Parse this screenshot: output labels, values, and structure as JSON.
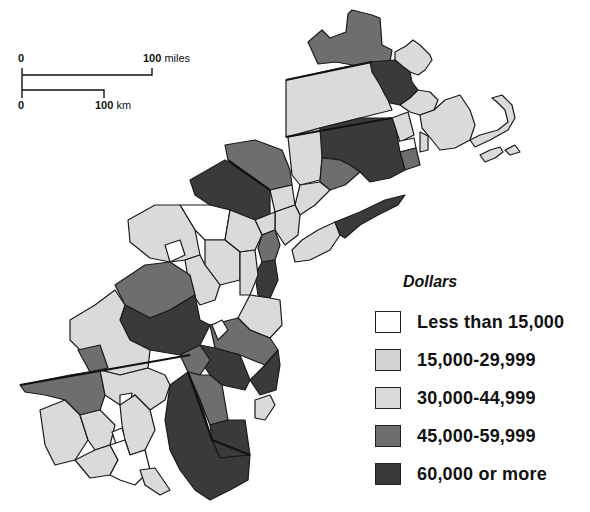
{
  "header": {
    "partial_title": "...ing..."
  },
  "scale_bar": {
    "miles": {
      "start": "0",
      "end": "100",
      "unit": "miles"
    },
    "km": {
      "start": "0",
      "end": "100",
      "unit": "km"
    }
  },
  "legend": {
    "title": "Dollars",
    "items": [
      {
        "label": "Less than 15,000",
        "color": "#ffffff"
      },
      {
        "label": "15,000-29,999",
        "color": "#d2d2d2"
      },
      {
        "label": "30,000-44,999",
        "color": "#dadada"
      },
      {
        "label": "45,000-59,999",
        "color": "#6e6e6e"
      },
      {
        "label": "60,000 or more",
        "color": "#3a3a3a"
      }
    ]
  },
  "map": {
    "region": "Northeastern United States (Boston–Washington corridor)",
    "colors": {
      "class_0": "#ffffff",
      "class_1": "#d2d2d2",
      "class_2": "#dadada",
      "class_3": "#6e6e6e",
      "class_4": "#3a3a3a",
      "outline": "#1a1a1a"
    }
  }
}
